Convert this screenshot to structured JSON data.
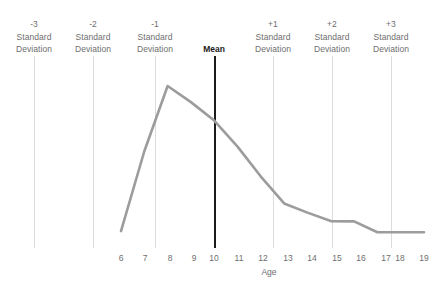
{
  "chart_data": {
    "type": "line",
    "title": "",
    "xlabel": "Age",
    "ylabel": "",
    "grid": false,
    "legend": "none",
    "x": [
      6,
      7,
      8,
      9,
      10,
      11,
      12,
      13,
      14,
      15,
      16,
      17,
      18,
      19
    ],
    "categories": [
      "6",
      "7",
      "8",
      "9",
      "10",
      "11",
      "12",
      "13",
      "14",
      "15",
      "16",
      "17",
      "18",
      "19"
    ],
    "xlim": [
      6,
      19
    ],
    "ylim": [
      0,
      1
    ],
    "series": [
      {
        "name": "Age distribution",
        "color": "#9c9c9c",
        "values": [
          0.055,
          0.575,
          1.0,
          0.895,
          0.775,
          0.605,
          0.41,
          0.235,
          0.175,
          0.12,
          0.118,
          0.047,
          0.047,
          0.047
        ]
      }
    ],
    "annotations": [
      {
        "id": "sd-minus-3",
        "level": "-3",
        "word1": "Standard",
        "word2": "Deviation",
        "x_value": 3.0,
        "bold": false,
        "color": "#dcdcdc"
      },
      {
        "id": "sd-minus-2",
        "level": "-2",
        "word1": "Standard",
        "word2": "Deviation",
        "x_value": 5.4,
        "bold": false,
        "color": "#dcdcdc"
      },
      {
        "id": "sd-minus-1",
        "level": "-1",
        "word1": "Standard",
        "word2": "Deviation",
        "x_value": 7.4,
        "bold": false,
        "color": "#dcdcdc"
      },
      {
        "id": "mean",
        "level": "Mean",
        "word1": "",
        "word2": "",
        "x_value": 10.0,
        "bold": true,
        "color": "#1b1b1b"
      },
      {
        "id": "sd-plus-1",
        "level": "+1",
        "word1": "Standard",
        "word2": "Deviation",
        "x_value": 12.6,
        "bold": false,
        "color": "#dcdcdc"
      },
      {
        "id": "sd-plus-2",
        "level": "+2",
        "word1": "Standard",
        "word2": "Deviation",
        "x_value": 15.2,
        "bold": false,
        "color": "#dcdcdc"
      },
      {
        "id": "sd-plus-3",
        "level": "+3",
        "word1": "Standard",
        "word2": "Deviation",
        "x_value": 17.8,
        "bold": false,
        "color": "#dcdcdc"
      }
    ]
  },
  "markers": {
    "sd_minus_3": {
      "level": "-3",
      "word1": "Standard",
      "word2": "Deviation"
    },
    "sd_minus_2": {
      "level": "-2",
      "word1": "Standard",
      "word2": "Deviation"
    },
    "sd_minus_1": {
      "level": "-1",
      "word1": "Standard",
      "word2": "Deviation"
    },
    "mean": {
      "label": "Mean"
    },
    "sd_plus_1": {
      "level": "+1",
      "word1": "Standard",
      "word2": "Deviation"
    },
    "sd_plus_2": {
      "level": "+2",
      "word1": "Standard",
      "word2": "Deviation"
    },
    "sd_plus_3": {
      "level": "+3",
      "word1": "Standard",
      "word2": "Deviation"
    }
  },
  "axis": {
    "x_title": "Age",
    "x_ticks": [
      "6",
      "7",
      "8",
      "9",
      "10",
      "11",
      "12",
      "13",
      "14",
      "15",
      "16",
      "17",
      "18",
      "19"
    ]
  },
  "colors": {
    "curve": "#9c9c9c",
    "gridline": "#dcdcdc",
    "mean_line": "#1b1b1b",
    "text": "#6e6e6e",
    "text_bold": "#1b1b1b",
    "background": "#ffffff"
  }
}
